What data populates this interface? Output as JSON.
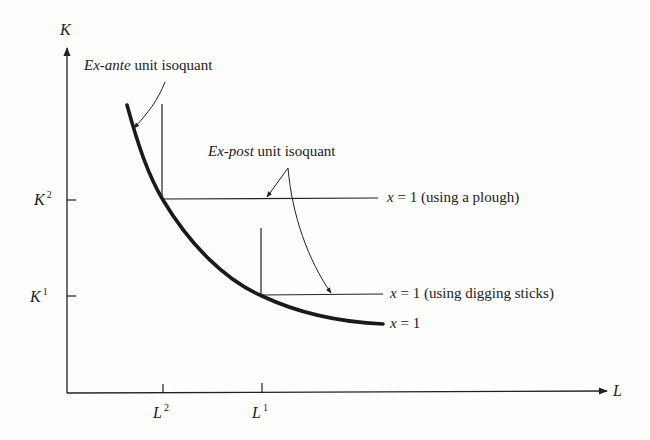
{
  "diagram": {
    "axes": {
      "y_label": "K",
      "x_label": "L",
      "y_ticks": [
        {
          "base": "K",
          "sup": "2"
        },
        {
          "base": "K",
          "sup": "1"
        }
      ],
      "x_ticks": [
        {
          "base": "L",
          "sup": "2"
        },
        {
          "base": "L",
          "sup": "1"
        }
      ]
    },
    "annotations": {
      "ex_ante": {
        "italic": "Ex-ante",
        "rest": " unit isoquant"
      },
      "ex_post": {
        "italic": "Ex-post",
        "rest": " unit isoquant"
      }
    },
    "curve_labels": {
      "plough": {
        "var": "x",
        "rest": " = 1 (using a plough)"
      },
      "sticks": {
        "var": "x",
        "rest": " = 1 (using digging sticks)"
      },
      "smooth": {
        "var": "x",
        "rest": " = 1"
      }
    },
    "colors": {
      "ink": "#222222",
      "background": "#fdfdfb"
    }
  }
}
